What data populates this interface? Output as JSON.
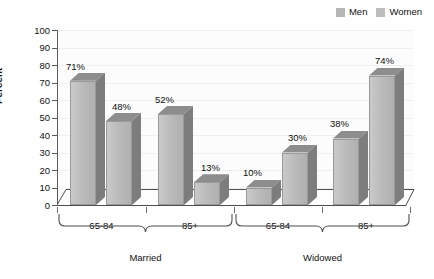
{
  "legend": {
    "position": "top-right",
    "entries": [
      {
        "label": "Men",
        "color": "#b5b5b5",
        "icon": "legend-swatch-icon"
      },
      {
        "label": "Women",
        "color": "#bdbdbd",
        "icon": "legend-swatch-icon"
      }
    ]
  },
  "axis": {
    "ylabel": "Percent",
    "yticks": [
      "0",
      "10",
      "20",
      "30",
      "40",
      "50",
      "60",
      "70",
      "80",
      "90",
      "100"
    ]
  },
  "chart_data": {
    "type": "bar",
    "title": "",
    "subtitle": "",
    "xlabel": "",
    "ylabel": "Percent",
    "ylim": [
      0,
      100
    ],
    "ytick_step": 10,
    "grid": true,
    "legend_position": "top-right",
    "style": "3d-clustered-column",
    "groups": [
      "Married",
      "Widowed"
    ],
    "categories": [
      "65-84",
      "85+",
      "65-84",
      "85+"
    ],
    "category_groups": [
      "Married",
      "Married",
      "Widowed",
      "Widowed"
    ],
    "series": [
      {
        "name": "Men",
        "values": [
          71,
          52,
          10,
          38
        ],
        "color": "#b5b5b5"
      },
      {
        "name": "Women",
        "values": [
          48,
          13,
          30,
          74
        ],
        "color": "#bdbdbd"
      }
    ],
    "data_labels": [
      "71%",
      "48%",
      "52%",
      "13%",
      "10%",
      "30%",
      "38%",
      "74%"
    ],
    "points": [
      {
        "group": "Married",
        "category": "65-84",
        "series": "Men",
        "value": 71,
        "label": "71%"
      },
      {
        "group": "Married",
        "category": "65-84",
        "series": "Women",
        "value": 48,
        "label": "48%"
      },
      {
        "group": "Married",
        "category": "85+",
        "series": "Men",
        "value": 52,
        "label": "52%"
      },
      {
        "group": "Married",
        "category": "85+",
        "series": "Women",
        "value": 13,
        "label": "13%"
      },
      {
        "group": "Widowed",
        "category": "65-84",
        "series": "Men",
        "value": 10,
        "label": "10%"
      },
      {
        "group": "Widowed",
        "category": "65-84",
        "series": "Women",
        "value": 30,
        "label": "30%"
      },
      {
        "group": "Widowed",
        "category": "85+",
        "series": "Men",
        "value": 38,
        "label": "38%"
      },
      {
        "group": "Widowed",
        "category": "85+",
        "series": "Women",
        "value": 74,
        "label": "74%"
      }
    ]
  },
  "categories": {
    "c0": "65-84",
    "c1": "85+",
    "c2": "65-84",
    "c3": "85+"
  },
  "groups": {
    "g0": "Married",
    "g1": "Widowed"
  },
  "labels": {
    "l0": "71%",
    "l1": "48%",
    "l2": "52%",
    "l3": "13%",
    "l4": "10%",
    "l5": "30%",
    "l6": "38%",
    "l7": "74%"
  },
  "yticks": {
    "t0": "0",
    "t10": "10",
    "t20": "20",
    "t30": "30",
    "t40": "40",
    "t50": "50",
    "t60": "60",
    "t70": "70",
    "t80": "80",
    "t90": "90",
    "t100": "100"
  }
}
